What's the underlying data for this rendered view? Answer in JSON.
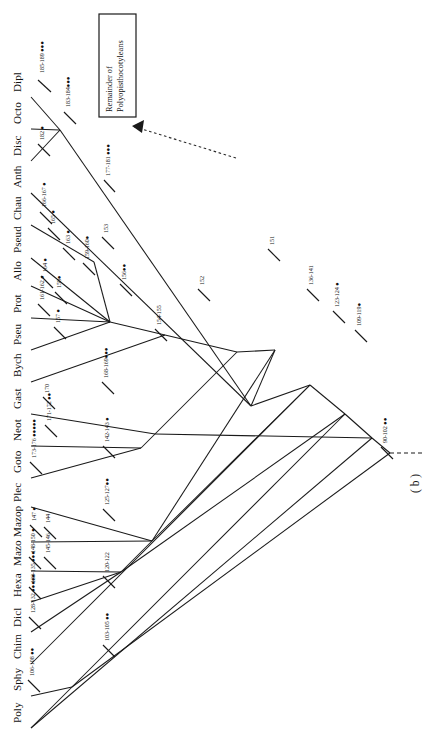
{
  "figure": {
    "panel_label": "( b )",
    "orientation": "rotated-90-ccw",
    "annotation_box": {
      "line1": "Remainder of",
      "line2": "Polyopisthocotyleans"
    }
  },
  "taxa": [
    {
      "id": "poly",
      "label": "Poly"
    },
    {
      "id": "sphy",
      "label": "Sphy"
    },
    {
      "id": "chim",
      "label": "Chim"
    },
    {
      "id": "dicl",
      "label": "Dicl"
    },
    {
      "id": "hexa",
      "label": "Hexa"
    },
    {
      "id": "mazo",
      "label": "Mazo"
    },
    {
      "id": "mazop",
      "label": "Mazop"
    },
    {
      "id": "plec",
      "label": "Plec"
    },
    {
      "id": "goto",
      "label": "Goto"
    },
    {
      "id": "neot",
      "label": "Neot"
    },
    {
      "id": "gast",
      "label": "Gast"
    },
    {
      "id": "bych",
      "label": "Bych"
    },
    {
      "id": "pseu",
      "label": "Pseu"
    },
    {
      "id": "prot",
      "label": "Prot"
    },
    {
      "id": "allo",
      "label": "Allo"
    },
    {
      "id": "pseud",
      "label": "Pseud"
    },
    {
      "id": "chau",
      "label": "Chau"
    },
    {
      "id": "anth",
      "label": "Anth"
    },
    {
      "id": "disc",
      "label": "Disc"
    },
    {
      "id": "octo",
      "label": "Octo"
    },
    {
      "id": "dipl",
      "label": "Dipl"
    }
  ],
  "character_labels": [
    {
      "id": "c185-189",
      "text": "185-189 ●●●"
    },
    {
      "id": "c183-184",
      "text": "183-184●●●"
    },
    {
      "id": "c182",
      "text": "182 ●"
    },
    {
      "id": "c177-181",
      "text": "177-181 ●●●"
    },
    {
      "id": "c166-167",
      "text": "166-167 ●"
    },
    {
      "id": "c165",
      "text": "165 ●"
    },
    {
      "id": "c163",
      "text": "163 ●"
    },
    {
      "id": "c164",
      "text": "164 ●"
    },
    {
      "id": "c161-162",
      "text": "161-162 ●"
    },
    {
      "id": "c158",
      "text": "158●"
    },
    {
      "id": "c157",
      "text": "157 ●"
    },
    {
      "id": "c159-160",
      "text": "159-160●"
    },
    {
      "id": "c153",
      "text": "153"
    },
    {
      "id": "c156",
      "text": "156●●"
    },
    {
      "id": "c154-155",
      "text": "154-155"
    },
    {
      "id": "c152",
      "text": "152"
    },
    {
      "id": "c151",
      "text": "151"
    },
    {
      "id": "c136-141",
      "text": "136-141"
    },
    {
      "id": "c123-124",
      "text": "123-124 ●"
    },
    {
      "id": "c109-119",
      "text": "109-119●"
    },
    {
      "id": "c90-102",
      "text": "90-102 ●●"
    },
    {
      "id": "c170",
      "text": "170"
    },
    {
      "id": "c171-172",
      "text": "171-172 ●●"
    },
    {
      "id": "c173-176",
      "text": "173-176 ●●●●●"
    },
    {
      "id": "c168-169",
      "text": "168-169●●●"
    },
    {
      "id": "c142-143",
      "text": "142-143 ●"
    },
    {
      "id": "c147",
      "text": "147 ●"
    },
    {
      "id": "c144",
      "text": "144"
    },
    {
      "id": "c145-146",
      "text": "145-146"
    },
    {
      "id": "c148-150",
      "text": "148-150 ●"
    },
    {
      "id": "c125-127",
      "text": "125-127●●"
    },
    {
      "id": "c133-135",
      "text": "133-135 ●●●"
    },
    {
      "id": "c128-132",
      "text": "128-132 ●●●●●"
    },
    {
      "id": "c120-122",
      "text": "120-122"
    },
    {
      "id": "c106-108",
      "text": "106-108 ●●"
    },
    {
      "id": "c103-105",
      "text": "103-105 ●●"
    }
  ],
  "colors": {
    "ink": "#1a1a1a",
    "background": "#ffffff"
  }
}
